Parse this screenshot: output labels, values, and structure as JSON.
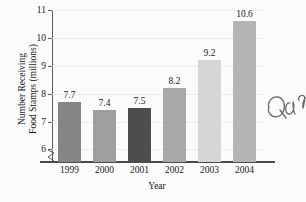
{
  "chart_data": {
    "type": "bar",
    "title": "",
    "subtitle": "",
    "xlabel": "Year",
    "ylabel_line1": "Number Receiving",
    "ylabel_line2": "Food Stamps (millions)",
    "categories": [
      "1999",
      "2000",
      "2001",
      "2002",
      "2003",
      "2004"
    ],
    "values": [
      7.7,
      7.4,
      7.5,
      8.2,
      9.2,
      10.6
    ],
    "value_labels": [
      "7.7",
      "7.4",
      "7.5",
      "8.2",
      "9.2",
      "10.6"
    ],
    "bar_colors": [
      "#858585",
      "#9e9e9e",
      "#4d4d4d",
      "#a8a8a8",
      "#d6d6d6",
      "#b4b4b4"
    ],
    "ylim": [
      5.55,
      11.0
    ],
    "ytick_values": [
      6,
      7,
      8,
      9,
      10,
      11
    ],
    "ytick_labels": [
      "6",
      "7",
      "8",
      "9",
      "10",
      "11"
    ],
    "grid": true,
    "grid_color": "#ececec",
    "axis_broken": true,
    "legend": "none",
    "background_color": "#fbfbfb",
    "axis_color": "#4a4a4a",
    "text_color": "#1a1a1a"
  },
  "annotation": {
    "handwriting_text": "Qua"
  }
}
